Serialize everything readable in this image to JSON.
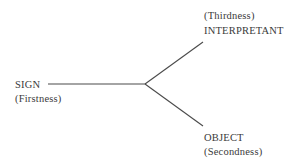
{
  "diagram": {
    "type": "triadic-tree",
    "sign": {
      "label": "SIGN",
      "category": "(Firstness)"
    },
    "interpretant": {
      "label": "INTERPRETANT",
      "category": "(Thirdness)"
    },
    "object": {
      "label": "OBJECT",
      "category": "(Secondness)"
    },
    "line_color": "#4a4a4a"
  }
}
